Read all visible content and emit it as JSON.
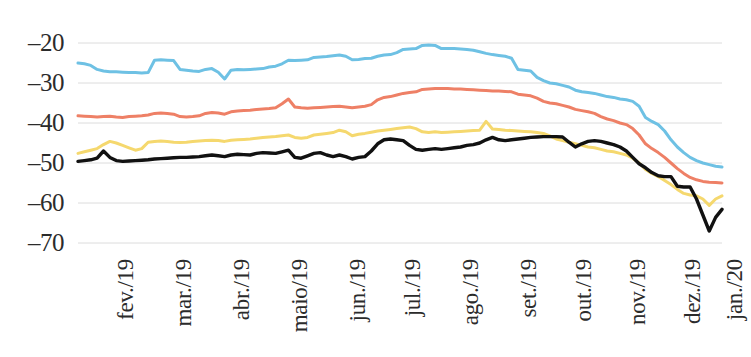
{
  "chart_data": {
    "type": "line",
    "title": "",
    "subtitle": "",
    "xlabel": "",
    "ylabel": "",
    "grid": true,
    "legend_position": "none",
    "ylim": [
      -70,
      -20
    ],
    "yticks": [
      -20,
      -30,
      -40,
      -50,
      -60,
      -70
    ],
    "ytick_labels": [
      "–20",
      "–30",
      "–40",
      "–50",
      "–60",
      "–70"
    ],
    "xtick_labels": [
      "fev./19",
      "mar./19",
      "abr./19",
      "maio/19",
      "jun./19",
      "jul./19",
      "ago./19",
      "set./19",
      "out./19",
      "nov./19",
      "dez./19",
      "jan./20"
    ],
    "xtick_positions": [
      0.055,
      0.145,
      0.235,
      0.325,
      0.415,
      0.5,
      0.59,
      0.68,
      0.765,
      0.85,
      0.935,
      1.0
    ],
    "colors": {
      "series_1": "#6EC1E4",
      "series_2": "#EE8066",
      "series_3": "#F5D86E",
      "series_4": "#111111",
      "gridline": "#DCDCDC",
      "text": "#2b2b2b",
      "background": "#FFFFFF"
    },
    "series": [
      {
        "name": "series_1",
        "color": "#6EC1E4",
        "values": [
          -25.0,
          -25.2,
          -25.6,
          -26.6,
          -27.0,
          -27.2,
          -27.2,
          -27.3,
          -27.4,
          -27.4,
          -27.5,
          -27.4,
          -24.3,
          -24.2,
          -24.3,
          -24.4,
          -26.6,
          -26.8,
          -27.0,
          -27.1,
          -26.6,
          -26.4,
          -27.3,
          -29.0,
          -26.8,
          -26.6,
          -26.7,
          -26.6,
          -26.5,
          -26.4,
          -26.0,
          -25.8,
          -25.2,
          -24.3,
          -24.4,
          -24.3,
          -24.2,
          -23.6,
          -23.5,
          -23.4,
          -23.2,
          -23.0,
          -23.3,
          -24.2,
          -24.1,
          -23.9,
          -23.8,
          -23.3,
          -23.0,
          -22.9,
          -22.4,
          -21.6,
          -21.5,
          -21.4,
          -20.6,
          -20.5,
          -20.6,
          -21.4,
          -21.4,
          -21.4,
          -21.5,
          -21.6,
          -21.8,
          -22.2,
          -22.6,
          -22.9,
          -23.1,
          -23.3,
          -23.8,
          -26.6,
          -26.8,
          -27.0,
          -28.6,
          -29.4,
          -30.0,
          -30.2,
          -30.6,
          -31.0,
          -31.8,
          -32.2,
          -32.4,
          -32.6,
          -33.0,
          -33.4,
          -33.6,
          -34.0,
          -34.2,
          -34.6,
          -35.8,
          -38.6,
          -39.6,
          -40.4,
          -42.0,
          -44.2,
          -46.0,
          -47.4,
          -48.6,
          -49.4,
          -50.0,
          -50.4,
          -50.8,
          -51.0
        ]
      },
      {
        "name": "series_2",
        "color": "#EE8066",
        "values": [
          -38.2,
          -38.3,
          -38.4,
          -38.5,
          -38.4,
          -38.3,
          -38.5,
          -38.6,
          -38.4,
          -38.3,
          -38.2,
          -38.0,
          -37.6,
          -37.5,
          -37.6,
          -37.8,
          -38.4,
          -38.5,
          -38.4,
          -38.2,
          -37.6,
          -37.4,
          -37.5,
          -37.8,
          -37.2,
          -37.0,
          -36.9,
          -36.8,
          -36.6,
          -36.5,
          -36.4,
          -36.2,
          -35.2,
          -34.0,
          -36.0,
          -36.2,
          -36.3,
          -36.2,
          -36.1,
          -36.0,
          -35.9,
          -35.8,
          -36.0,
          -36.2,
          -36.0,
          -35.8,
          -35.4,
          -34.2,
          -33.6,
          -33.4,
          -33.0,
          -32.6,
          -32.4,
          -32.2,
          -31.6,
          -31.5,
          -31.4,
          -31.4,
          -31.4,
          -31.5,
          -31.5,
          -31.6,
          -31.7,
          -31.8,
          -31.9,
          -32.0,
          -32.0,
          -32.1,
          -32.2,
          -32.8,
          -33.0,
          -33.2,
          -33.8,
          -34.6,
          -35.0,
          -35.2,
          -35.6,
          -36.0,
          -36.6,
          -36.9,
          -37.2,
          -37.6,
          -38.4,
          -39.0,
          -39.4,
          -40.0,
          -40.4,
          -41.4,
          -43.0,
          -45.2,
          -46.4,
          -47.4,
          -48.6,
          -50.0,
          -51.4,
          -52.6,
          -53.6,
          -54.2,
          -54.6,
          -54.8,
          -54.9,
          -55.0
        ]
      },
      {
        "name": "series_3",
        "color": "#F5D86E",
        "values": [
          -47.6,
          -47.2,
          -46.8,
          -46.4,
          -45.4,
          -44.6,
          -45.0,
          -45.6,
          -46.2,
          -46.8,
          -46.4,
          -44.8,
          -44.6,
          -44.5,
          -44.6,
          -44.8,
          -44.9,
          -44.8,
          -44.6,
          -44.5,
          -44.4,
          -44.3,
          -44.4,
          -44.6,
          -44.3,
          -44.2,
          -44.1,
          -44.0,
          -43.8,
          -43.6,
          -43.5,
          -43.4,
          -43.2,
          -43.0,
          -43.6,
          -43.8,
          -43.6,
          -43.0,
          -42.8,
          -42.6,
          -42.4,
          -41.8,
          -42.2,
          -43.2,
          -42.8,
          -42.6,
          -42.3,
          -42.0,
          -41.8,
          -41.6,
          -41.4,
          -41.2,
          -41.0,
          -41.4,
          -42.2,
          -42.4,
          -42.2,
          -42.4,
          -42.3,
          -42.2,
          -42.1,
          -42.0,
          -41.9,
          -41.8,
          -39.6,
          -41.5,
          -41.6,
          -41.8,
          -41.9,
          -42.0,
          -42.1,
          -42.2,
          -42.4,
          -42.6,
          -43.2,
          -44.0,
          -44.4,
          -44.8,
          -45.2,
          -45.6,
          -46.0,
          -46.2,
          -46.6,
          -47.0,
          -47.2,
          -47.6,
          -48.0,
          -48.8,
          -50.0,
          -51.6,
          -52.6,
          -53.4,
          -54.4,
          -55.4,
          -56.6,
          -57.6,
          -58.0,
          -58.2,
          -59.0,
          -60.6,
          -59.0,
          -58.2
        ]
      },
      {
        "name": "series_4",
        "color": "#111111",
        "values": [
          -49.6,
          -49.4,
          -49.2,
          -48.8,
          -47.0,
          -48.6,
          -49.4,
          -49.6,
          -49.5,
          -49.4,
          -49.3,
          -49.2,
          -49.0,
          -48.9,
          -48.8,
          -48.7,
          -48.6,
          -48.6,
          -48.5,
          -48.4,
          -48.2,
          -48.0,
          -48.2,
          -48.4,
          -48.0,
          -47.8,
          -47.9,
          -48.0,
          -47.6,
          -47.4,
          -47.5,
          -47.6,
          -47.2,
          -46.8,
          -48.6,
          -48.8,
          -48.2,
          -47.6,
          -47.4,
          -48.0,
          -48.4,
          -48.0,
          -48.4,
          -49.0,
          -48.6,
          -48.4,
          -47.0,
          -45.2,
          -44.2,
          -44.0,
          -44.2,
          -44.4,
          -45.6,
          -46.6,
          -46.8,
          -46.6,
          -46.4,
          -46.6,
          -46.4,
          -46.2,
          -46.0,
          -45.6,
          -45.4,
          -45.0,
          -44.2,
          -43.6,
          -44.2,
          -44.4,
          -44.2,
          -44.0,
          -43.8,
          -43.6,
          -43.5,
          -43.4,
          -43.4,
          -43.4,
          -43.5,
          -44.8,
          -46.0,
          -45.2,
          -44.6,
          -44.4,
          -44.6,
          -45.0,
          -45.4,
          -46.0,
          -47.0,
          -48.6,
          -50.2,
          -51.2,
          -52.4,
          -53.2,
          -53.4,
          -53.4,
          -55.8,
          -56.0,
          -56.0,
          -59.0,
          -63.0,
          -67.0,
          -63.6,
          -61.6
        ]
      }
    ]
  }
}
